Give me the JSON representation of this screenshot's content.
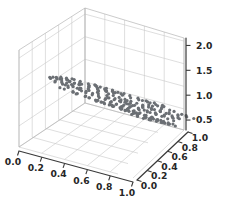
{
  "figure": {
    "background_color": "#ffffff",
    "pane_color": "#ffffff",
    "grid_color": "#c8c8c8",
    "spine_color": "#3a3a3a",
    "tick_label_color": "#262626",
    "marker_color": "#6b6f74"
  },
  "chart_data": {
    "type": "scatter",
    "projection": "3d",
    "title": "",
    "xlabel": "",
    "ylabel": "",
    "zlabel": "",
    "grid": true,
    "legend": null,
    "xlim": [
      0.0,
      1.0
    ],
    "ylim": [
      0.0,
      1.0
    ],
    "zlim": [
      0.3,
      2.15
    ],
    "xticks": [
      "0.0",
      "0.2",
      "0.4",
      "0.6",
      "0.8",
      "1.0"
    ],
    "yticks": [
      "0.0",
      "0.2",
      "0.4",
      "0.6",
      "0.8",
      "1.0"
    ],
    "zticks": [
      "0.5",
      "1.0",
      "1.5",
      "2.0"
    ],
    "xtick_values": [
      0.0,
      0.2,
      0.4,
      0.6,
      0.8,
      1.0
    ],
    "ytick_values": [
      0.0,
      0.2,
      0.4,
      0.6,
      0.8,
      1.0
    ],
    "ztick_values": [
      0.5,
      1.0,
      1.5,
      2.0
    ],
    "marker_size": 2.0,
    "n_points": 236,
    "points": [
      [
        0.06,
        0.46,
        1.28
      ],
      [
        0.09,
        0.42,
        1.3
      ],
      [
        0.07,
        0.5,
        1.22
      ],
      [
        0.12,
        0.44,
        1.26
      ],
      [
        0.14,
        0.48,
        1.2
      ],
      [
        0.1,
        0.55,
        1.18
      ],
      [
        0.17,
        0.41,
        1.24
      ],
      [
        0.2,
        0.47,
        1.19
      ],
      [
        0.16,
        0.52,
        1.15
      ],
      [
        0.22,
        0.44,
        1.21
      ],
      [
        0.19,
        0.58,
        1.12
      ],
      [
        0.25,
        0.49,
        1.16
      ],
      [
        0.23,
        0.54,
        1.1
      ],
      [
        0.27,
        0.45,
        1.18
      ],
      [
        0.3,
        0.5,
        1.12
      ],
      [
        0.26,
        0.6,
        1.06
      ],
      [
        0.32,
        0.46,
        1.14
      ],
      [
        0.29,
        0.56,
        1.08
      ],
      [
        0.35,
        0.51,
        1.1
      ],
      [
        0.33,
        0.62,
        1.02
      ],
      [
        0.37,
        0.47,
        1.12
      ],
      [
        0.31,
        0.67,
        0.99
      ],
      [
        0.39,
        0.53,
        1.06
      ],
      [
        0.36,
        0.58,
        1.04
      ],
      [
        0.42,
        0.49,
        1.08
      ],
      [
        0.4,
        0.64,
        0.98
      ],
      [
        0.44,
        0.55,
        1.02
      ],
      [
        0.38,
        0.7,
        0.95
      ],
      [
        0.46,
        0.51,
        1.05
      ],
      [
        0.43,
        0.6,
        0.99
      ],
      [
        0.48,
        0.57,
        0.97
      ],
      [
        0.41,
        0.72,
        0.92
      ],
      [
        0.5,
        0.52,
        1.01
      ],
      [
        0.47,
        0.63,
        0.95
      ],
      [
        0.52,
        0.58,
        0.94
      ],
      [
        0.45,
        0.74,
        0.89
      ],
      [
        0.54,
        0.54,
        0.98
      ],
      [
        0.51,
        0.66,
        0.91
      ],
      [
        0.56,
        0.6,
        0.9
      ],
      [
        0.49,
        0.76,
        0.86
      ],
      [
        0.58,
        0.55,
        0.95
      ],
      [
        0.55,
        0.68,
        0.88
      ],
      [
        0.6,
        0.62,
        0.87
      ],
      [
        0.53,
        0.78,
        0.83
      ],
      [
        0.62,
        0.57,
        0.91
      ],
      [
        0.59,
        0.7,
        0.85
      ],
      [
        0.64,
        0.64,
        0.83
      ],
      [
        0.57,
        0.8,
        0.8
      ],
      [
        0.66,
        0.59,
        0.88
      ],
      [
        0.63,
        0.72,
        0.81
      ],
      [
        0.68,
        0.66,
        0.8
      ],
      [
        0.61,
        0.82,
        0.77
      ],
      [
        0.7,
        0.61,
        0.84
      ],
      [
        0.67,
        0.74,
        0.78
      ],
      [
        0.72,
        0.68,
        0.76
      ],
      [
        0.65,
        0.84,
        0.74
      ],
      [
        0.74,
        0.63,
        0.81
      ],
      [
        0.71,
        0.76,
        0.74
      ],
      [
        0.76,
        0.7,
        0.73
      ],
      [
        0.69,
        0.86,
        0.7
      ],
      [
        0.78,
        0.65,
        0.77
      ],
      [
        0.75,
        0.78,
        0.71
      ],
      [
        0.8,
        0.72,
        0.69
      ],
      [
        0.73,
        0.88,
        0.67
      ],
      [
        0.82,
        0.67,
        0.74
      ],
      [
        0.79,
        0.8,
        0.68
      ],
      [
        0.84,
        0.74,
        0.66
      ],
      [
        0.77,
        0.9,
        0.64
      ],
      [
        0.86,
        0.69,
        0.7
      ],
      [
        0.83,
        0.82,
        0.64
      ],
      [
        0.88,
        0.76,
        0.62
      ],
      [
        0.81,
        0.92,
        0.6
      ],
      [
        0.9,
        0.71,
        0.67
      ],
      [
        0.87,
        0.84,
        0.61
      ],
      [
        0.92,
        0.78,
        0.59
      ],
      [
        0.85,
        0.94,
        0.57
      ],
      [
        0.05,
        0.38,
        1.34
      ],
      [
        0.08,
        0.34,
        1.37
      ],
      [
        0.11,
        0.36,
        1.32
      ],
      [
        0.13,
        0.32,
        1.35
      ],
      [
        0.15,
        0.39,
        1.29
      ],
      [
        0.18,
        0.35,
        1.31
      ],
      [
        0.21,
        0.38,
        1.27
      ],
      [
        0.24,
        0.33,
        1.3
      ],
      [
        0.28,
        0.4,
        1.25
      ],
      [
        0.34,
        0.36,
        1.27
      ],
      [
        0.02,
        0.6,
        1.14
      ],
      [
        0.04,
        0.65,
        1.09
      ],
      [
        0.06,
        0.7,
        1.05
      ],
      [
        0.09,
        0.68,
        1.07
      ],
      [
        0.12,
        0.72,
        1.02
      ],
      [
        0.15,
        0.66,
        1.06
      ],
      [
        0.18,
        0.74,
        0.99
      ],
      [
        0.21,
        0.7,
        1.01
      ],
      [
        0.24,
        0.76,
        0.96
      ],
      [
        0.27,
        0.72,
        0.98
      ],
      [
        0.3,
        0.78,
        0.93
      ],
      [
        0.33,
        0.74,
        0.95
      ],
      [
        0.36,
        0.8,
        0.9
      ],
      [
        0.39,
        0.76,
        0.92
      ],
      [
        0.42,
        0.82,
        0.88
      ],
      [
        0.45,
        0.79,
        0.89
      ],
      [
        0.48,
        0.85,
        0.85
      ],
      [
        0.51,
        0.81,
        0.86
      ],
      [
        0.54,
        0.87,
        0.82
      ],
      [
        0.57,
        0.83,
        0.84
      ],
      [
        0.6,
        0.89,
        0.79
      ],
      [
        0.63,
        0.86,
        0.81
      ],
      [
        0.66,
        0.91,
        0.77
      ],
      [
        0.69,
        0.88,
        0.78
      ],
      [
        0.72,
        0.93,
        0.74
      ],
      [
        0.75,
        0.9,
        0.76
      ],
      [
        0.44,
        0.4,
        1.12
      ],
      [
        0.47,
        0.36,
        1.15
      ],
      [
        0.5,
        0.42,
        1.09
      ],
      [
        0.53,
        0.38,
        1.12
      ],
      [
        0.56,
        0.44,
        1.06
      ],
      [
        0.59,
        0.4,
        1.09
      ],
      [
        0.62,
        0.46,
        1.03
      ],
      [
        0.65,
        0.42,
        1.06
      ],
      [
        0.68,
        0.48,
        1.0
      ],
      [
        0.71,
        0.44,
        1.03
      ],
      [
        0.74,
        0.5,
        0.97
      ],
      [
        0.77,
        0.46,
        1.0
      ],
      [
        0.8,
        0.52,
        0.94
      ],
      [
        0.83,
        0.48,
        0.97
      ],
      [
        0.86,
        0.54,
        0.91
      ],
      [
        0.89,
        0.5,
        0.94
      ],
      [
        0.92,
        0.56,
        0.88
      ],
      [
        0.95,
        0.52,
        0.91
      ],
      [
        0.3,
        0.3,
        1.28
      ],
      [
        0.35,
        0.28,
        1.29
      ],
      [
        0.4,
        0.32,
        1.24
      ],
      [
        0.45,
        0.29,
        1.26
      ],
      [
        0.5,
        0.33,
        1.21
      ],
      [
        0.55,
        0.3,
        1.23
      ],
      [
        0.6,
        0.34,
        1.18
      ],
      [
        0.65,
        0.31,
        1.2
      ],
      [
        0.7,
        0.35,
        1.15
      ],
      [
        0.75,
        0.32,
        1.17
      ],
      [
        0.8,
        0.36,
        1.12
      ],
      [
        0.85,
        0.33,
        1.14
      ],
      [
        0.9,
        0.37,
        1.09
      ],
      [
        0.95,
        0.34,
        1.11
      ],
      [
        0.5,
        0.66,
        0.92
      ],
      [
        0.53,
        0.69,
        0.89
      ],
      [
        0.56,
        0.72,
        0.86
      ],
      [
        0.59,
        0.64,
        0.93
      ],
      [
        0.62,
        0.68,
        0.89
      ],
      [
        0.65,
        0.75,
        0.83
      ],
      [
        0.68,
        0.7,
        0.87
      ],
      [
        0.71,
        0.78,
        0.8
      ],
      [
        0.74,
        0.73,
        0.84
      ],
      [
        0.77,
        0.81,
        0.77
      ],
      [
        0.8,
        0.76,
        0.81
      ],
      [
        0.83,
        0.84,
        0.74
      ],
      [
        0.86,
        0.79,
        0.78
      ],
      [
        0.89,
        0.87,
        0.71
      ],
      [
        0.92,
        0.82,
        0.75
      ],
      [
        0.95,
        0.9,
        0.68
      ],
      [
        0.14,
        0.6,
        1.1
      ],
      [
        0.17,
        0.63,
        1.07
      ],
      [
        0.2,
        0.57,
        1.13
      ],
      [
        0.23,
        0.66,
        1.04
      ],
      [
        0.26,
        0.61,
        1.08
      ],
      [
        0.29,
        0.69,
        1.01
      ],
      [
        0.32,
        0.64,
        1.05
      ],
      [
        0.35,
        0.72,
        0.98
      ],
      [
        0.38,
        0.67,
        1.02
      ],
      [
        0.41,
        0.75,
        0.95
      ],
      [
        0.6,
        0.55,
        0.99
      ],
      [
        0.64,
        0.58,
        0.96
      ],
      [
        0.67,
        0.52,
        1.02
      ],
      [
        0.7,
        0.6,
        0.94
      ],
      [
        0.73,
        0.56,
        0.97
      ],
      [
        0.76,
        0.63,
        0.91
      ],
      [
        0.79,
        0.58,
        0.95
      ],
      [
        0.82,
        0.65,
        0.89
      ],
      [
        0.85,
        0.61,
        0.92
      ],
      [
        0.88,
        0.68,
        0.86
      ],
      [
        0.91,
        0.63,
        0.9
      ],
      [
        0.94,
        0.7,
        0.84
      ],
      [
        0.97,
        0.66,
        0.87
      ],
      [
        0.99,
        0.72,
        0.82
      ],
      [
        0.22,
        0.24,
        1.36
      ],
      [
        0.27,
        0.22,
        1.38
      ],
      [
        0.33,
        0.25,
        1.33
      ],
      [
        0.38,
        0.21,
        1.36
      ],
      [
        0.43,
        0.26,
        1.3
      ],
      [
        0.48,
        0.23,
        1.33
      ],
      [
        0.53,
        0.27,
        1.27
      ],
      [
        0.58,
        0.24,
        1.3
      ],
      [
        0.63,
        0.28,
        1.24
      ],
      [
        0.68,
        0.25,
        1.27
      ],
      [
        0.73,
        0.29,
        1.21
      ],
      [
        0.78,
        0.26,
        1.24
      ],
      [
        0.83,
        0.3,
        1.18
      ],
      [
        0.88,
        0.27,
        1.21
      ],
      [
        0.93,
        0.31,
        1.15
      ],
      [
        0.98,
        0.28,
        1.18
      ],
      [
        0.55,
        0.92,
        0.74
      ],
      [
        0.6,
        0.95,
        0.7
      ],
      [
        0.66,
        0.96,
        0.67
      ],
      [
        0.71,
        0.94,
        0.69
      ],
      [
        0.76,
        0.97,
        0.64
      ],
      [
        0.81,
        0.95,
        0.66
      ],
      [
        0.86,
        0.98,
        0.61
      ],
      [
        0.91,
        0.96,
        0.63
      ],
      [
        0.96,
        0.99,
        0.58
      ],
      [
        0.64,
        0.86,
        0.76
      ],
      [
        0.69,
        0.83,
        0.79
      ],
      [
        0.74,
        0.88,
        0.73
      ],
      [
        0.03,
        0.52,
        1.2
      ],
      [
        0.05,
        0.56,
        1.16
      ],
      [
        0.08,
        0.6,
        1.12
      ],
      [
        0.02,
        0.48,
        1.24
      ],
      [
        0.11,
        0.58,
        1.13
      ],
      [
        0.16,
        0.56,
        1.14
      ],
      [
        0.19,
        0.62,
        1.09
      ],
      [
        0.13,
        0.54,
        1.17
      ],
      [
        0.88,
        0.58,
        0.84
      ],
      [
        0.92,
        0.6,
        0.82
      ],
      [
        0.95,
        0.62,
        0.8
      ],
      [
        0.98,
        0.64,
        0.78
      ],
      [
        0.9,
        0.44,
        0.98
      ],
      [
        0.94,
        0.46,
        0.96
      ],
      [
        0.97,
        0.48,
        0.94
      ],
      [
        0.99,
        0.5,
        0.92
      ],
      [
        0.46,
        0.66,
        0.94
      ],
      [
        0.49,
        0.7,
        0.9
      ],
      [
        0.52,
        0.74,
        0.87
      ],
      [
        0.43,
        0.62,
        0.97
      ],
      [
        0.37,
        0.86,
        0.84
      ],
      [
        0.4,
        0.9,
        0.8
      ],
      [
        0.34,
        0.83,
        0.87
      ],
      [
        0.31,
        0.88,
        0.83
      ],
      [
        0.25,
        0.8,
        0.92
      ],
      [
        0.28,
        0.84,
        0.88
      ],
      [
        0.22,
        0.78,
        0.95
      ],
      [
        0.19,
        0.82,
        0.91
      ],
      [
        0.78,
        0.36,
        1.08
      ],
      [
        0.82,
        0.38,
        1.05
      ],
      [
        0.86,
        0.4,
        1.02
      ],
      [
        0.9,
        0.42,
        1.0
      ]
    ]
  }
}
